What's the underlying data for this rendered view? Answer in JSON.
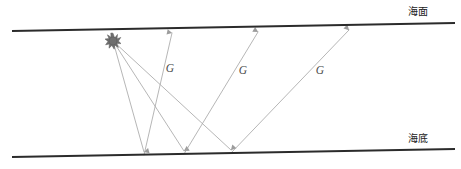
{
  "figure": {
    "width": 461,
    "height": 169,
    "background_color": "#ffffff"
  },
  "boundaries": [
    {
      "id": "sea-surface",
      "label": "海面",
      "label_x": 418,
      "label_y": 14,
      "x1": 12,
      "y1": 31,
      "x2": 455,
      "y2": 23,
      "color": "#2b2b2b"
    },
    {
      "id": "sea-bottom",
      "label": "海底",
      "label_x": 418,
      "label_y": 142,
      "x1": 12,
      "y1": 157,
      "x2": 455,
      "y2": 149,
      "color": "#2b2b2b"
    }
  ],
  "source": {
    "name": "seismic-source",
    "x": 113,
    "y": 41,
    "symbol": "starburst",
    "color": "#6e6e6e",
    "outer_radius": 7.5,
    "inner_radius": 3.4,
    "points": 11
  },
  "ray_color": "#a9a9a9",
  "raypaths": [
    {
      "id": "raypath-1",
      "down_label": "",
      "up_label": "G",
      "bounce_x": 144,
      "bounce_y": 155,
      "receiver_x": 172,
      "receiver_y": 30,
      "label_x": 170,
      "label_y": 72
    },
    {
      "id": "raypath-2",
      "down_label": "",
      "up_label": "G",
      "bounce_x": 184,
      "bounce_y": 154,
      "receiver_x": 258,
      "receiver_y": 29,
      "label_x": 243,
      "label_y": 74
    },
    {
      "id": "raypath-3",
      "down_label": "",
      "up_label": "G",
      "bounce_x": 231,
      "bounce_y": 153,
      "receiver_x": 349,
      "receiver_y": 27,
      "label_x": 320,
      "label_y": 74
    }
  ],
  "ray_labels": [
    "G",
    "G",
    "G"
  ]
}
